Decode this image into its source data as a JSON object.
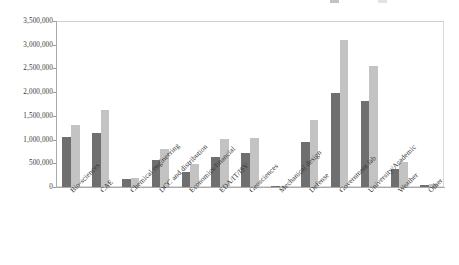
{
  "chart": {
    "type": "bar",
    "title": "",
    "legend_note": "legend cropped at top edge of image (two faint series markers, text not visible)"
  },
  "chart_data": {
    "type": "bar",
    "title": "",
    "xlabel": "",
    "ylabel": "",
    "ylim": [
      0,
      3500000
    ],
    "yticks": [
      0,
      500000,
      1000000,
      1500000,
      2000000,
      2500000,
      3000000,
      3500000
    ],
    "ytick_labels": [
      "0",
      "500,000",
      "1,000,000",
      "1,500,000",
      "2,000,000",
      "2,500,000",
      "3,000,000",
      "3,500,000"
    ],
    "grid": false,
    "legend_position": "top-right (cropped)",
    "categories": [
      "Bio-sciences",
      "CAE",
      "Chemical engineering",
      "DCC and distribution",
      "Economics/financial",
      "EDA/IT/ISV",
      "Geosciences",
      "Mechanical design",
      "Defense",
      "Government lab",
      "University/Academic",
      "Weather",
      "Other"
    ],
    "series": [
      {
        "name": "Series 1",
        "color": "#6f6f6f",
        "values": [
          1060000,
          1140000,
          165000,
          580000,
          315000,
          630000,
          710000,
          30000,
          950000,
          1990000,
          1820000,
          380000,
          35000
        ]
      },
      {
        "name": "Series 2",
        "color": "#c3c3c3",
        "values": [
          1300000,
          1615000,
          190000,
          800000,
          475000,
          1010000,
          1040000,
          25000,
          1410000,
          3105000,
          2550000,
          520000,
          55000
        ]
      }
    ]
  }
}
